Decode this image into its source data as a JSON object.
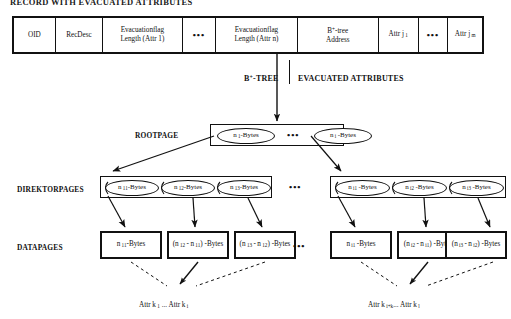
{
  "title": "RECORD WITH EVACUATED ATTRIBUTES",
  "record": {
    "cells": [
      {
        "l1": "OID",
        "l2": ""
      },
      {
        "l1": "RecDesc",
        "l2": ""
      },
      {
        "l1": "Evacuationflag",
        "l2": "Length (Attr 1)"
      },
      {
        "l1": "…",
        "l2": ""
      },
      {
        "l1": "Evacuationflag",
        "l2": "Length (Attr n)"
      },
      {
        "l1": "B+-tree",
        "l2": "Address"
      },
      {
        "l1": "Attr j 1",
        "l2": ""
      },
      {
        "l1": "…",
        "l2": ""
      },
      {
        "l1": "Attr j m",
        "l2": ""
      }
    ]
  },
  "mid": {
    "left_label": "B+-TREE",
    "right_label": "EVACUATED ATTRIBUTES"
  },
  "rows": {
    "rootpage_label": "ROOTPAGE",
    "direktorpages_label": "DIREKTORPAGES",
    "datapages_label": "DATAPAGES"
  },
  "rootpage": {
    "entries": [
      "n 1 -Bytes",
      "n i -Bytes"
    ],
    "ellipsis": "•••"
  },
  "direktorpages": {
    "group_left": [
      "n 11 -Bytes",
      "n 12 -Bytes",
      "n 13 -Bytes"
    ],
    "group_right": [
      "n i1 -Bytes",
      "n i2 -Bytes",
      "n i3 -Bytes"
    ],
    "ellipsis": "•••"
  },
  "datapages": {
    "group_left": [
      {
        "l1": "n 11 -Bytes",
        "l2": ""
      },
      {
        "l1": "(n 12 - n 11 )",
        "l2": "-Bytes"
      },
      {
        "l1": "(n 13 - n 12 )",
        "l2": "-Bytes"
      }
    ],
    "group_right": [
      {
        "l1": "n i1 -Bytes",
        "l2": ""
      },
      {
        "l1": "(n i2 - n i1 )",
        "l2": "-Bytes"
      },
      {
        "l1": "(n i3 - n i2 )",
        "l2": "-Bytes"
      }
    ],
    "ellipsis": "•••"
  },
  "bottom": {
    "left_label": "Attr k 1 ... Attr k i",
    "right_label": "Attr k i+k ... Attr k l"
  },
  "colors": {
    "ink": "#111111",
    "background": "#ffffff"
  }
}
